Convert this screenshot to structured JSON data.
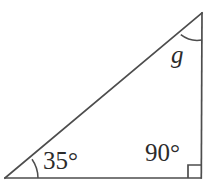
{
  "figure": {
    "name": "right-triangle-angles",
    "background_color": "#ffffff",
    "stroke_color": "#4d4d4d",
    "text_color": "#2b2b2b",
    "stroke_width": 1.6,
    "vertices": {
      "bottom_left": {
        "x": 5,
        "y": 178
      },
      "bottom_right": {
        "x": 201,
        "y": 178
      },
      "top_right": {
        "x": 202,
        "y": 13
      }
    },
    "sides": [
      {
        "name": "base",
        "from": "bottom_left",
        "to": "bottom_right"
      },
      {
        "name": "vertical-right-side",
        "from": "bottom_right",
        "to": "top_right"
      },
      {
        "name": "hypotenuse",
        "from": "bottom_left",
        "to": "top_right"
      }
    ],
    "angles": [
      {
        "name": "angle-bottom-left",
        "label": "35°",
        "value": 35,
        "unit": "degrees",
        "marker": "arc",
        "arc_radius": 33,
        "vertex": "bottom_left"
      },
      {
        "name": "angle-bottom-right",
        "label": "90°",
        "value": 90,
        "unit": "degrees",
        "marker": "square",
        "marker_size": 13,
        "vertex": "bottom_right"
      },
      {
        "name": "angle-top-right",
        "label": "g",
        "value": null,
        "unit": "degrees",
        "marker": "arc",
        "arc_radius": 27,
        "vertex": "top_right"
      }
    ]
  },
  "labels": {
    "angle_35": "35°",
    "angle_90": "90°",
    "angle_g": "g"
  }
}
